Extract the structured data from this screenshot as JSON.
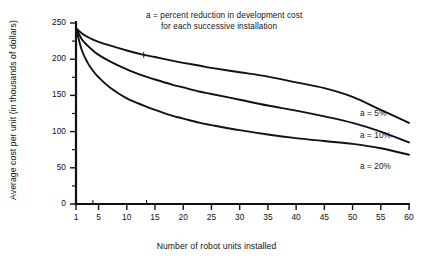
{
  "chart_data": {
    "type": "line",
    "title": "",
    "annotation": [
      "a  =  percent reduction in development cost",
      "for each successive installation"
    ],
    "xlabel": "Number of robot units installed",
    "ylabel": "Average cost per unit (in thousands of dollars)",
    "xlim": [
      1,
      60
    ],
    "ylim": [
      0,
      250
    ],
    "xticks": [
      1,
      5,
      10,
      15,
      20,
      25,
      30,
      35,
      40,
      45,
      50,
      55,
      60
    ],
    "xtick_labels": [
      "1",
      "5",
      "10",
      "15",
      "20",
      "25",
      "30",
      "35",
      "40",
      "45",
      "50",
      "55",
      "60"
    ],
    "yticks": [
      0,
      50,
      100,
      150,
      200,
      250
    ],
    "ytick_labels": [
      "0",
      "50",
      "100",
      "150",
      "200",
      "250"
    ],
    "grid": false,
    "legend_position": "right-inline",
    "x": [
      1,
      2,
      3,
      4,
      5,
      7,
      10,
      13,
      15,
      18,
      20,
      23,
      25,
      30,
      35,
      40,
      45,
      50,
      55,
      60
    ],
    "series": [
      {
        "name": "a = 5%",
        "label": "a  =  5%",
        "color": "#111111",
        "values": [
          243,
          236,
          231,
          227,
          224,
          219,
          212,
          206,
          203,
          198,
          195,
          191,
          188,
          182,
          176,
          168,
          160,
          148,
          130,
          112
        ]
      },
      {
        "name": "a = 10%",
        "label": "a  =  10%",
        "color": "#111111",
        "values": [
          243,
          228,
          219,
          212,
          206,
          197,
          186,
          177,
          172,
          165,
          161,
          155,
          152,
          144,
          136,
          129,
          121,
          112,
          100,
          85
        ]
      },
      {
        "name": "a = 20%",
        "label": "a  =  20%",
        "color": "#111111",
        "values": [
          243,
          213,
          196,
          184,
          175,
          161,
          146,
          136,
          130,
          122,
          118,
          112,
          109,
          102,
          96,
          91,
          87,
          83,
          77,
          68
        ]
      }
    ]
  },
  "axis": {
    "axis_color": "#111111",
    "tick_color": "#111111"
  }
}
